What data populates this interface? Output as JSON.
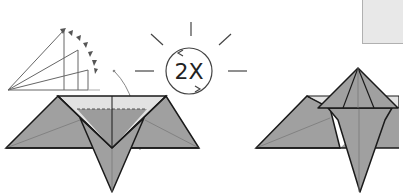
{
  "diagram": {
    "type": "origami-instructions",
    "cut_heading": "",
    "steps": [
      {
        "id": "step-left",
        "repeat_indicator": "2X",
        "description": "Fold flaps up repeatedly (fan fold) — repeat twice",
        "valley_fold_line": "dashed"
      },
      {
        "id": "step-right",
        "description": "Result: raised pyramid flap on top of model"
      }
    ],
    "colors": {
      "paper_fill": "#a0a0a0",
      "paper_light": "#e2e2e2",
      "outline": "#1a1a1a",
      "crease": "#7a7a7a",
      "arrow": "#555555",
      "sun_rays": "#444444",
      "top_box": "#e8e8e8"
    }
  }
}
